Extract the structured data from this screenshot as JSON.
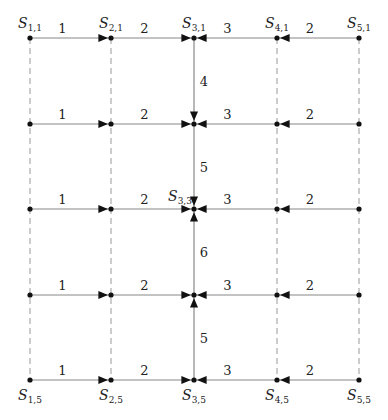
{
  "diagram": {
    "type": "grid-graph",
    "columns_x": [
      30,
      111,
      194,
      277,
      359
    ],
    "rows_y": [
      38,
      124,
      209,
      295,
      380
    ],
    "node_labels": [
      {
        "name": "S",
        "sub": "1,1",
        "col": 0,
        "row": 0,
        "pos": "above"
      },
      {
        "name": "S",
        "sub": "2,1",
        "col": 1,
        "row": 0,
        "pos": "above"
      },
      {
        "name": "S",
        "sub": "3,1",
        "col": 2,
        "row": 0,
        "pos": "above"
      },
      {
        "name": "S",
        "sub": "4,1",
        "col": 3,
        "row": 0,
        "pos": "above"
      },
      {
        "name": "S",
        "sub": "5,1",
        "col": 4,
        "row": 0,
        "pos": "above"
      },
      {
        "name": "S",
        "sub": "3,3",
        "col": 2,
        "row": 2,
        "pos": "above-left"
      },
      {
        "name": "S",
        "sub": "1,5",
        "col": 0,
        "row": 4,
        "pos": "below"
      },
      {
        "name": "S",
        "sub": "2,5",
        "col": 1,
        "row": 4,
        "pos": "below"
      },
      {
        "name": "S",
        "sub": "3,5",
        "col": 2,
        "row": 4,
        "pos": "below"
      },
      {
        "name": "S",
        "sub": "4,5",
        "col": 3,
        "row": 4,
        "pos": "below"
      },
      {
        "name": "S",
        "sub": "5,5",
        "col": 4,
        "row": 4,
        "pos": "below"
      }
    ],
    "horizontal_edge_weights": [
      "1",
      "2",
      "3",
      "2"
    ],
    "horizontal_edges": [
      {
        "from": 0,
        "to": 1,
        "weight": "1",
        "arrow": "right"
      },
      {
        "from": 1,
        "to": 2,
        "weight": "2",
        "arrow": "right"
      },
      {
        "from": 3,
        "to": 2,
        "weight": "3",
        "arrow": "left"
      },
      {
        "from": 4,
        "to": 3,
        "weight": "2",
        "arrow": "left"
      }
    ],
    "vertical_edges": [
      {
        "col": 2,
        "from": 0,
        "to": 1,
        "weight": "4",
        "arrow": "down"
      },
      {
        "col": 2,
        "from": 1,
        "to": 2,
        "weight": "5",
        "arrow": "down"
      },
      {
        "col": 2,
        "from": 3,
        "to": 2,
        "weight": "6",
        "arrow": "up"
      },
      {
        "col": 2,
        "from": 4,
        "to": 3,
        "weight": "5",
        "arrow": "up"
      }
    ],
    "dashed_columns": [
      0,
      1,
      3,
      4
    ],
    "colors": {
      "edge": "#888888",
      "dashed": "#999999",
      "node": "#111111",
      "arrow": "#111111",
      "text": "#222222"
    }
  }
}
